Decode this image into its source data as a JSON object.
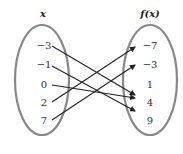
{
  "diagram": {
    "type": "mapping-diagram",
    "domain_header": "x",
    "range_header": "f(x)",
    "domain_values": [
      "−3",
      "−1",
      "0",
      "2",
      "7"
    ],
    "range_values": [
      "−7",
      "−3",
      "1",
      "4",
      "9"
    ],
    "mappings": [
      {
        "from": "−3",
        "to": "4"
      },
      {
        "from": "−1",
        "to": "9"
      },
      {
        "from": "0",
        "to": "4"
      },
      {
        "from": "2",
        "to": "−7"
      },
      {
        "from": "7",
        "to": "−3"
      }
    ],
    "colors": {
      "oval": "#888888",
      "arrow": "#222222",
      "text": "#333333"
    }
  }
}
